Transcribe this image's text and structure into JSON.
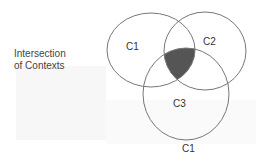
{
  "caption": {
    "line1": "Intersection",
    "line2": "of Contexts"
  },
  "sets": [
    {
      "id": "C1",
      "label": "C1"
    },
    {
      "id": "C2",
      "label": "C2"
    },
    {
      "id": "C3",
      "label": "C3"
    }
  ],
  "footer_label": "C1",
  "colors": {
    "stroke": "#666666",
    "intersection_fill": "#555555"
  }
}
